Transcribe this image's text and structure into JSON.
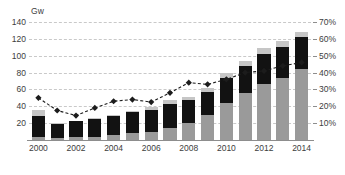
{
  "chart_data": {
    "type": "bar",
    "title": "",
    "subtitle": "",
    "xlabel": "",
    "ylabel": "Gw",
    "ylim": [
      0,
      140
    ],
    "ylim_right": [
      0,
      70
    ],
    "ylabel_right": "%",
    "grid": true,
    "legend": "none",
    "categories": [
      "2000",
      "2001",
      "2002",
      "2003",
      "2004",
      "2005",
      "2006",
      "2007",
      "2008",
      "2009",
      "2010",
      "2011",
      "2012",
      "2013",
      "2014"
    ],
    "tick_labels_x": [
      "2000",
      "2002",
      "2004",
      "2006",
      "2008",
      "2010",
      "2012",
      "2014"
    ],
    "tick_labels_y_left": [
      "140",
      "120",
      "100",
      "80",
      "60",
      "40",
      "20"
    ],
    "tick_values_y_left": [
      140,
      120,
      100,
      80,
      60,
      40,
      20
    ],
    "tick_labels_y_right": [
      "70%",
      "60%",
      "50%",
      "40%",
      "30%",
      "20%",
      "10%"
    ],
    "tick_values_y_right": [
      70,
      60,
      50,
      40,
      30,
      20,
      10
    ],
    "series": [
      {
        "name": "lower-segment",
        "color": "#9a9a9a",
        "values": [
          4,
          2,
          3,
          4,
          6,
          8,
          10,
          14,
          20,
          30,
          44,
          56,
          66,
          74,
          84
        ]
      },
      {
        "name": "middle-segment",
        "color": "#121212",
        "values": [
          25,
          17,
          19,
          21,
          22,
          25,
          26,
          29,
          27,
          27,
          30,
          32,
          36,
          36,
          38
        ]
      },
      {
        "name": "upper-segment",
        "color": "#c6c6c6",
        "values": [
          7,
          1,
          1,
          1,
          2,
          2,
          3,
          4,
          4,
          5,
          6,
          6,
          7,
          7,
          6
        ]
      }
    ],
    "totals": [
      36,
      20,
      23,
      26,
      30,
      35,
      39,
      47,
      51,
      62,
      80,
      94,
      109,
      117,
      128
    ],
    "line_series": {
      "name": "percent-line",
      "axis": "right",
      "color": "#1c1c1c",
      "marker": "diamond",
      "style": "dashed",
      "values": [
        25,
        17.5,
        14.5,
        19,
        23,
        24,
        22.5,
        28,
        34,
        33,
        36,
        40,
        41,
        44,
        46
      ]
    }
  }
}
